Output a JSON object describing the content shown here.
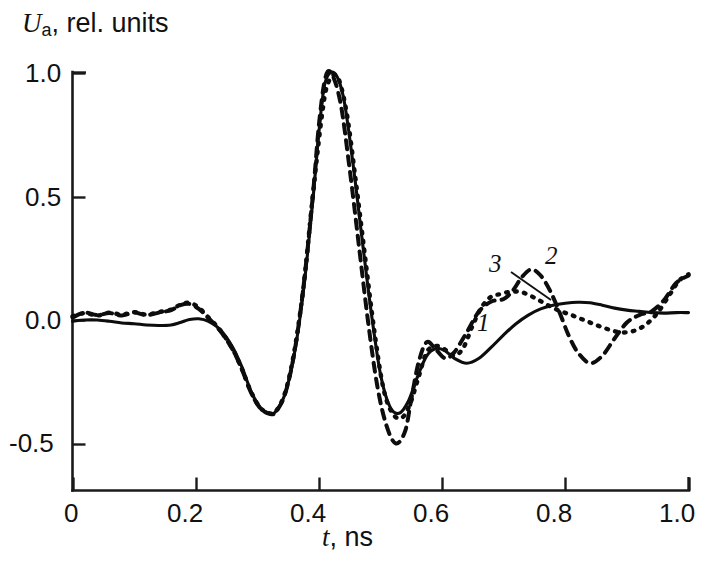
{
  "figure": {
    "background": "#ffffff",
    "ink_color": "#0d0d0d"
  },
  "axes": {
    "y_label_main": "U",
    "y_label_sub": "a",
    "y_label_rest": ", rel. units",
    "x_label_main": "t",
    "x_label_rest": ", ns",
    "y_ticks": [
      "1.0",
      "0.5",
      "0.0",
      "-0.5"
    ],
    "x_ticks": [
      "0",
      "0.2",
      "0.4",
      "0.6",
      "0.8",
      "1.0"
    ]
  },
  "curve_labels": {
    "one": "1",
    "two": "2",
    "three": "3"
  },
  "chart_data": {
    "type": "line",
    "title": "",
    "xlabel": "t, ns",
    "ylabel": "U_a, rel. units",
    "xlim": [
      0.0,
      1.0
    ],
    "ylim": [
      -0.62,
      1.05
    ],
    "xticks": [
      0.0,
      0.2,
      0.4,
      0.6,
      0.8,
      1.0
    ],
    "yticks": [
      -0.5,
      0.0,
      0.5,
      1.0
    ],
    "grid": false,
    "legend": "inline curve numbers 1, 2, 3",
    "annotations": [
      {
        "text": "1",
        "x": 0.668,
        "y": -0.02,
        "style": "italic"
      },
      {
        "text": "2",
        "x": 0.782,
        "y": 0.265,
        "style": "italic"
      },
      {
        "text": "3",
        "x": 0.692,
        "y": 0.225,
        "style": "italic",
        "leader_to": {
          "x": 0.757,
          "y": 0.112
        }
      }
    ],
    "series": [
      {
        "name": "1",
        "style": "solid",
        "x": [
          0.0,
          0.02,
          0.04,
          0.06,
          0.08,
          0.1,
          0.12,
          0.14,
          0.16,
          0.175,
          0.19,
          0.205,
          0.22,
          0.24,
          0.26,
          0.275,
          0.29,
          0.305,
          0.32,
          0.33,
          0.345,
          0.36,
          0.375,
          0.39,
          0.4,
          0.41,
          0.425,
          0.44,
          0.455,
          0.47,
          0.485,
          0.5,
          0.515,
          0.53,
          0.545,
          0.56,
          0.575,
          0.59,
          0.605,
          0.62,
          0.64,
          0.66,
          0.68,
          0.7,
          0.72,
          0.74,
          0.76,
          0.78,
          0.8,
          0.82,
          0.84,
          0.86,
          0.88,
          0.9,
          0.92,
          0.94,
          0.96,
          0.98,
          1.0
        ],
        "y": [
          -0.005,
          0.0,
          0.0,
          -0.005,
          -0.012,
          -0.015,
          -0.02,
          -0.022,
          -0.02,
          -0.01,
          0.002,
          0.005,
          -0.005,
          -0.04,
          -0.11,
          -0.19,
          -0.29,
          -0.355,
          -0.378,
          -0.37,
          -0.3,
          -0.14,
          0.12,
          0.48,
          0.76,
          0.96,
          1.0,
          0.9,
          0.64,
          0.33,
          0.03,
          -0.22,
          -0.35,
          -0.378,
          -0.33,
          -0.23,
          -0.145,
          -0.115,
          -0.125,
          -0.155,
          -0.175,
          -0.155,
          -0.11,
          -0.06,
          -0.015,
          0.02,
          0.045,
          0.06,
          0.068,
          0.072,
          0.07,
          0.06,
          0.048,
          0.04,
          0.035,
          0.03,
          0.028,
          0.03,
          0.03
        ]
      },
      {
        "name": "2",
        "style": "dashed",
        "x": [
          0.0,
          0.02,
          0.04,
          0.06,
          0.08,
          0.1,
          0.12,
          0.14,
          0.16,
          0.175,
          0.19,
          0.205,
          0.22,
          0.24,
          0.26,
          0.275,
          0.29,
          0.305,
          0.32,
          0.33,
          0.345,
          0.36,
          0.375,
          0.39,
          0.4,
          0.41,
          0.42,
          0.435,
          0.45,
          0.465,
          0.48,
          0.495,
          0.51,
          0.525,
          0.54,
          0.55,
          0.562,
          0.575,
          0.59,
          0.605,
          0.62,
          0.64,
          0.66,
          0.68,
          0.7,
          0.715,
          0.73,
          0.745,
          0.76,
          0.775,
          0.79,
          0.805,
          0.82,
          0.84,
          0.86,
          0.88,
          0.9,
          0.92,
          0.94,
          0.96,
          0.98,
          1.0
        ],
        "y": [
          0.01,
          0.03,
          0.02,
          0.028,
          0.018,
          0.03,
          0.02,
          0.03,
          0.04,
          0.06,
          0.065,
          0.045,
          0.01,
          -0.045,
          -0.12,
          -0.2,
          -0.295,
          -0.358,
          -0.38,
          -0.372,
          -0.3,
          -0.135,
          0.135,
          0.5,
          0.79,
          0.975,
          1.0,
          0.88,
          0.61,
          0.3,
          -0.01,
          -0.27,
          -0.43,
          -0.5,
          -0.45,
          -0.32,
          -0.17,
          -0.09,
          -0.12,
          -0.155,
          -0.13,
          -0.05,
          0.035,
          0.075,
          0.085,
          0.12,
          0.175,
          0.205,
          0.18,
          0.12,
          0.035,
          -0.06,
          -0.13,
          -0.175,
          -0.145,
          -0.075,
          -0.01,
          0.02,
          0.035,
          0.08,
          0.15,
          0.18
        ]
      },
      {
        "name": "3",
        "style": "dotted",
        "x": [
          0.0,
          0.02,
          0.04,
          0.06,
          0.08,
          0.1,
          0.12,
          0.14,
          0.16,
          0.175,
          0.19,
          0.205,
          0.22,
          0.24,
          0.26,
          0.275,
          0.29,
          0.305,
          0.32,
          0.33,
          0.345,
          0.36,
          0.375,
          0.39,
          0.405,
          0.415,
          0.43,
          0.445,
          0.46,
          0.475,
          0.49,
          0.505,
          0.52,
          0.535,
          0.548,
          0.562,
          0.575,
          0.59,
          0.605,
          0.62,
          0.635,
          0.65,
          0.665,
          0.68,
          0.695,
          0.712,
          0.73,
          0.75,
          0.77,
          0.79,
          0.81,
          0.83,
          0.85,
          0.87,
          0.89,
          0.91,
          0.93,
          0.95,
          0.97,
          0.985,
          1.0
        ],
        "y": [
          0.015,
          0.028,
          0.018,
          0.03,
          0.022,
          0.032,
          0.022,
          0.032,
          0.042,
          0.062,
          0.07,
          0.05,
          0.012,
          -0.042,
          -0.118,
          -0.198,
          -0.292,
          -0.356,
          -0.378,
          -0.37,
          -0.295,
          -0.128,
          0.135,
          0.5,
          0.83,
          0.96,
          0.985,
          0.84,
          0.56,
          0.255,
          -0.045,
          -0.28,
          -0.38,
          -0.395,
          -0.34,
          -0.23,
          -0.13,
          -0.105,
          -0.12,
          -0.145,
          -0.11,
          -0.02,
          0.055,
          0.095,
          0.105,
          0.115,
          0.112,
          0.09,
          0.062,
          0.038,
          0.02,
          0.0,
          -0.02,
          -0.038,
          -0.05,
          -0.045,
          -0.02,
          0.03,
          0.105,
          0.16,
          0.185
        ]
      }
    ]
  }
}
